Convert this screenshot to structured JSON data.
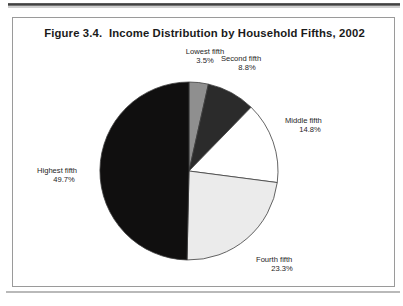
{
  "figure": {
    "title": "Figure 3.4.  Income Distribution by Household Fifths, 2002"
  },
  "chart_data": {
    "type": "pie",
    "title": "Figure 3.4.  Income Distribution by Household Fifths, 2002",
    "xlabel": "",
    "ylabel": "",
    "legend_position": "callout labels around slices",
    "grid": false,
    "start_angle_deg": 0,
    "direction": "clockwise",
    "units": "percent of aggregate household income",
    "categories": [
      "Lowest fifth",
      "Second fifth",
      "Middle fifth",
      "Fourth fifth",
      "Highest fifth"
    ],
    "values": [
      3.5,
      8.8,
      14.8,
      23.3,
      49.7
    ],
    "value_labels": [
      "3.5%",
      "8.8%",
      "14.8%",
      "23.3%",
      "49.7%"
    ],
    "slices": [
      {
        "name": "Lowest fifth",
        "value": 3.5,
        "value_label": "3.5%",
        "color": "#8f8f8f",
        "start_angle_deg": 0.0,
        "end_angle_deg": 12.6
      },
      {
        "name": "Second fifth",
        "value": 8.8,
        "value_label": "8.8%",
        "color": "#2b2b2b",
        "start_angle_deg": 12.6,
        "end_angle_deg": 44.28
      },
      {
        "name": "Middle fifth",
        "value": 14.8,
        "value_label": "14.8%",
        "color": "#ffffff",
        "start_angle_deg": 44.28,
        "end_angle_deg": 97.56
      },
      {
        "name": "Fourth fifth",
        "value": 23.3,
        "value_label": "23.3%",
        "color": "#ebebeb",
        "start_angle_deg": 97.56,
        "end_angle_deg": 181.44
      },
      {
        "name": "Highest fifth",
        "value": 49.7,
        "value_label": "49.7%",
        "color": "#100f0f",
        "start_angle_deg": 181.44,
        "end_angle_deg": 360.0
      }
    ],
    "total": 100.1
  }
}
